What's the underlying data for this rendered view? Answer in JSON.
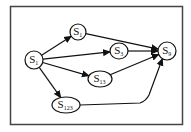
{
  "diagram": {
    "type": "directed-graph",
    "frame": {
      "x": 10,
      "y": 6,
      "w": 173,
      "h": 119,
      "color": "#444444"
    },
    "nodes": [
      {
        "id": "n0",
        "base": "S",
        "sub": "1",
        "cx": 34,
        "cy": 60,
        "rx": 9,
        "ry": 9
      },
      {
        "id": "n1",
        "base": "S",
        "sub": "1",
        "cx": 78,
        "cy": 32,
        "rx": 8,
        "ry": 8
      },
      {
        "id": "n2",
        "base": "S",
        "sub": "3",
        "cx": 119,
        "cy": 51,
        "rx": 9,
        "ry": 8
      },
      {
        "id": "n3",
        "base": "S",
        "sub": "9",
        "cx": 167,
        "cy": 51,
        "rx": 9,
        "ry": 9
      },
      {
        "id": "n4",
        "base": "S",
        "sub": "13",
        "cx": 100,
        "cy": 79,
        "rx": 12,
        "ry": 8
      },
      {
        "id": "n5",
        "base": "S",
        "sub": "123",
        "cx": 66,
        "cy": 105,
        "rx": 14,
        "ry": 8
      }
    ],
    "edges": [
      {
        "from": "n0",
        "to": "n1"
      },
      {
        "from": "n0",
        "to": "n2"
      },
      {
        "from": "n0",
        "to": "n4"
      },
      {
        "from": "n0",
        "to": "n5"
      },
      {
        "from": "n1",
        "to": "n3"
      },
      {
        "from": "n2",
        "to": "n3"
      },
      {
        "from": "n4",
        "to": "n3"
      },
      {
        "from": "n5",
        "to": "n3"
      }
    ]
  }
}
